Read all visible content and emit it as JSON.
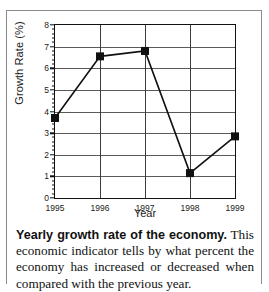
{
  "chart_data": {
    "type": "line",
    "title": "",
    "xlabel": "Year",
    "ylabel": "Growth Rate (%)",
    "categories": [
      "1995",
      "1996",
      "1997",
      "1998",
      "1999"
    ],
    "x": [
      1995,
      1996,
      1997,
      1998,
      1999
    ],
    "values": [
      3.7,
      6.55,
      6.8,
      1.15,
      2.85
    ],
    "series": [
      {
        "name": "Growth Rate",
        "values": [
          3.7,
          6.55,
          6.8,
          1.15,
          2.85
        ]
      }
    ],
    "ylim": [
      0,
      8
    ],
    "xlim": [
      1995,
      1999
    ],
    "ytick_labels": [
      "0",
      "1",
      "2",
      "3",
      "4",
      "5",
      "6",
      "7",
      "8"
    ],
    "ytick_values": [
      0,
      1,
      2,
      3,
      4,
      5,
      6,
      7,
      8
    ],
    "yminor_interval": 0.2,
    "xtick_labels": [
      "1995",
      "1996",
      "1997",
      "1998",
      "1999"
    ],
    "grid": "both",
    "legend": "none",
    "marker": "square",
    "line_color": "#111111",
    "marker_color": "#111111",
    "grid_color": "#5a5a5a"
  },
  "caption": {
    "lead": "Yearly growth rate of the economy.",
    "body": " This economic indicator tells by what percent the economy has increased or decreased when compared with the previous year."
  }
}
